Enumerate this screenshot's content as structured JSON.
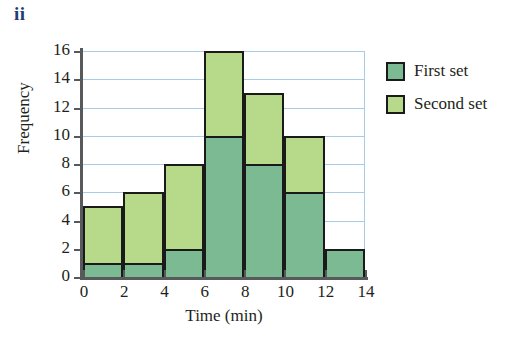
{
  "part_label": "ii",
  "legend": {
    "position": "right",
    "items": [
      {
        "label": "First set",
        "color": "#7cba94"
      },
      {
        "label": "Second set",
        "color": "#b6d98a"
      }
    ]
  },
  "chart_data": {
    "type": "bar",
    "subtype": "stacked-histogram",
    "title": "",
    "xlabel": "Time (min)",
    "ylabel": "Frequency",
    "xlim": [
      0,
      14
    ],
    "ylim": [
      0,
      16
    ],
    "xticks": [
      0,
      2,
      4,
      6,
      8,
      10,
      12,
      14
    ],
    "yticks": [
      0,
      2,
      4,
      6,
      8,
      10,
      12,
      14,
      16
    ],
    "xtick_labels": [
      "0",
      "2",
      "4",
      "6",
      "8",
      "10",
      "12",
      "14"
    ],
    "ytick_labels": [
      "0",
      "2",
      "4",
      "6",
      "8",
      "10",
      "12",
      "14",
      "16"
    ],
    "grid": true,
    "grid_color": "#a8cbe8",
    "bin_width": 2,
    "bins": [
      "0-2",
      "2-4",
      "4-6",
      "6-8",
      "8-10",
      "10-12",
      "12-14"
    ],
    "categories": [
      "0-2",
      "2-4",
      "4-6",
      "6-8",
      "8-10",
      "10-12",
      "12-14"
    ],
    "series": [
      {
        "name": "First set",
        "color": "#7cba94",
        "values": [
          1,
          1,
          2,
          10,
          8,
          6,
          2
        ]
      },
      {
        "name": "Second set",
        "color": "#b6d98a",
        "values": [
          4,
          5,
          6,
          6,
          5,
          4,
          0
        ]
      }
    ],
    "cumulative_tops": [
      5,
      6,
      8,
      16,
      13,
      10,
      2
    ],
    "annotations": []
  }
}
